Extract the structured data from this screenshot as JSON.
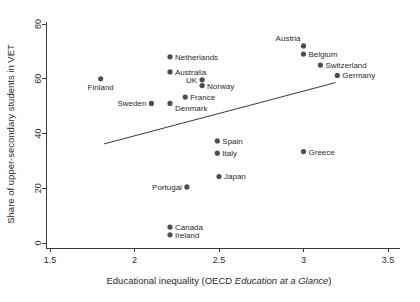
{
  "chart_data": {
    "type": "scatter",
    "title": "",
    "xlabel": "Educational inequality (OECD Education at a Glance)",
    "xlabel_plain": "Educational inequality (OECD ",
    "xlabel_italic": "Education at a Glance",
    "xlabel_tail": ")",
    "ylabel": "Share of upper-secondary students in VET",
    "xlim": [
      1.5,
      3.5
    ],
    "ylim": [
      0,
      80
    ],
    "xticks": [
      1.5,
      2,
      2.5,
      3,
      3.5
    ],
    "xtick_labels": [
      "1.5",
      "2",
      "2.5",
      "3",
      "3.5"
    ],
    "yticks": [
      0,
      20,
      40,
      60,
      80
    ],
    "ytick_labels": [
      "0",
      "20",
      "40",
      "60",
      "80"
    ],
    "grid": false,
    "legend": false,
    "marker_color": "#4d4d4d",
    "axis_color": "#3a3a3a",
    "fit_line": {
      "label": "linear fit",
      "x_start": 1.82,
      "y_start": 36.2,
      "x_end": 3.19,
      "y_end": 58.6
    },
    "points": [
      {
        "label": "Finland",
        "x": 1.8,
        "y": 60.0,
        "label_pos": "below"
      },
      {
        "label": "Sweden",
        "x": 2.1,
        "y": 51.0,
        "label_pos": "left"
      },
      {
        "label": "Australia",
        "x": 2.21,
        "y": 62.5,
        "label_pos": "right"
      },
      {
        "label": "Netherlands",
        "x": 2.21,
        "y": 68.0,
        "label_pos": "right"
      },
      {
        "label": "Denmark",
        "x": 2.21,
        "y": 51.0,
        "label_pos": "below-right"
      },
      {
        "label": "Canada",
        "x": 2.21,
        "y": 5.8,
        "label_pos": "right"
      },
      {
        "label": "Ireland",
        "x": 2.21,
        "y": 3.0,
        "label_pos": "right"
      },
      {
        "label": "France",
        "x": 2.3,
        "y": 53.3,
        "label_pos": "right"
      },
      {
        "label": "Portugal",
        "x": 2.31,
        "y": 20.5,
        "label_pos": "left"
      },
      {
        "label": "UK",
        "x": 2.4,
        "y": 59.6,
        "label_pos": "left"
      },
      {
        "label": "Norway",
        "x": 2.4,
        "y": 57.5,
        "label_pos": "right"
      },
      {
        "label": "Spain",
        "x": 2.49,
        "y": 37.3,
        "label_pos": "right"
      },
      {
        "label": "Italy",
        "x": 2.49,
        "y": 32.8,
        "label_pos": "right"
      },
      {
        "label": "Japan",
        "x": 2.5,
        "y": 24.3,
        "label_pos": "right"
      },
      {
        "label": "Austria",
        "x": 3.0,
        "y": 72.0,
        "label_pos": "above-left"
      },
      {
        "label": "Belgium",
        "x": 3.0,
        "y": 69.0,
        "label_pos": "right"
      },
      {
        "label": "Greece",
        "x": 3.0,
        "y": 33.4,
        "label_pos": "right"
      },
      {
        "label": "Switzerland",
        "x": 3.1,
        "y": 65.0,
        "label_pos": "right"
      },
      {
        "label": "Germany",
        "x": 3.2,
        "y": 61.2,
        "label_pos": "right"
      }
    ]
  }
}
